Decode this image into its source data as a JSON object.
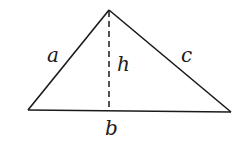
{
  "diagram": {
    "type": "triangle-with-altitude",
    "vertices": {
      "apex": [
        109,
        10
      ],
      "bottom_left": [
        28,
        110
      ],
      "bottom_right": [
        231,
        112
      ]
    },
    "altitude": {
      "from": [
        109,
        10
      ],
      "to": [
        109,
        111
      ],
      "style": "dashed"
    },
    "labels": {
      "side_a": "a",
      "side_c": "c",
      "height": "h",
      "base": "b"
    },
    "stroke_color": "#1a1a1a"
  }
}
